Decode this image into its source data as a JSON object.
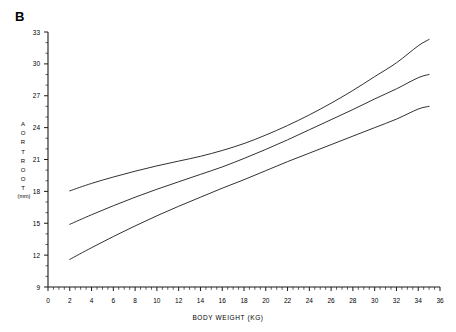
{
  "figure": {
    "panel_label": "B",
    "background_color": "#ffffff",
    "line_color": "#1a1a1a"
  },
  "axis_titles": {
    "y_letters": [
      "A",
      "O",
      "R",
      "T",
      "R",
      "O",
      "O",
      "T"
    ],
    "y_units": "(mm)",
    "x_title": "BODY WEIGHT  (KG)"
  },
  "chart_data": {
    "type": "line",
    "title": "B",
    "xlabel": "BODY WEIGHT  (KG)",
    "ylabel": "AORTROOT (mm)",
    "xlim": [
      0,
      36
    ],
    "ylim": [
      9,
      33
    ],
    "grid": false,
    "legend": "none",
    "xticks": [
      0,
      2,
      4,
      6,
      8,
      10,
      12,
      14,
      16,
      18,
      20,
      22,
      24,
      26,
      28,
      30,
      32,
      34,
      36
    ],
    "xtick_labels": [
      "0",
      "2",
      "4",
      "6",
      "8",
      "10",
      "12",
      "14",
      "16",
      "18",
      "20",
      "22",
      "24",
      "26",
      "28",
      "30",
      "32",
      "34",
      "36"
    ],
    "yticks": [
      9,
      12,
      15,
      18,
      21,
      24,
      27,
      30,
      33
    ],
    "ytick_labels": [
      "9",
      "12",
      "15",
      "18",
      "21",
      "24",
      "27",
      "30",
      "33"
    ],
    "x_minor_tick_step": 0.5,
    "y_minor_tick_step": 1,
    "series": [
      {
        "name": "upper",
        "x": [
          2,
          4,
          6,
          8,
          10,
          12,
          14,
          16,
          18,
          20,
          22,
          24,
          26,
          28,
          30,
          32,
          34,
          35
        ],
        "values": [
          18.05,
          18.75,
          19.35,
          19.9,
          20.4,
          20.85,
          21.3,
          21.85,
          22.5,
          23.3,
          24.2,
          25.2,
          26.3,
          27.5,
          28.8,
          30.1,
          31.7,
          32.3
        ]
      },
      {
        "name": "mean",
        "x": [
          2,
          4,
          6,
          8,
          10,
          12,
          14,
          16,
          18,
          20,
          22,
          24,
          26,
          28,
          30,
          32,
          34,
          35
        ],
        "values": [
          14.9,
          15.8,
          16.65,
          17.45,
          18.2,
          18.9,
          19.6,
          20.3,
          21.1,
          21.95,
          22.85,
          23.8,
          24.75,
          25.7,
          26.7,
          27.65,
          28.7,
          29.0
        ]
      },
      {
        "name": "lower",
        "x": [
          2,
          4,
          6,
          8,
          10,
          12,
          14,
          16,
          18,
          20,
          22,
          24,
          26,
          28,
          30,
          32,
          34,
          35
        ],
        "values": [
          11.6,
          12.7,
          13.75,
          14.75,
          15.7,
          16.6,
          17.45,
          18.3,
          19.1,
          19.95,
          20.8,
          21.6,
          22.4,
          23.2,
          24.0,
          24.8,
          25.75,
          26.0
        ]
      }
    ]
  }
}
